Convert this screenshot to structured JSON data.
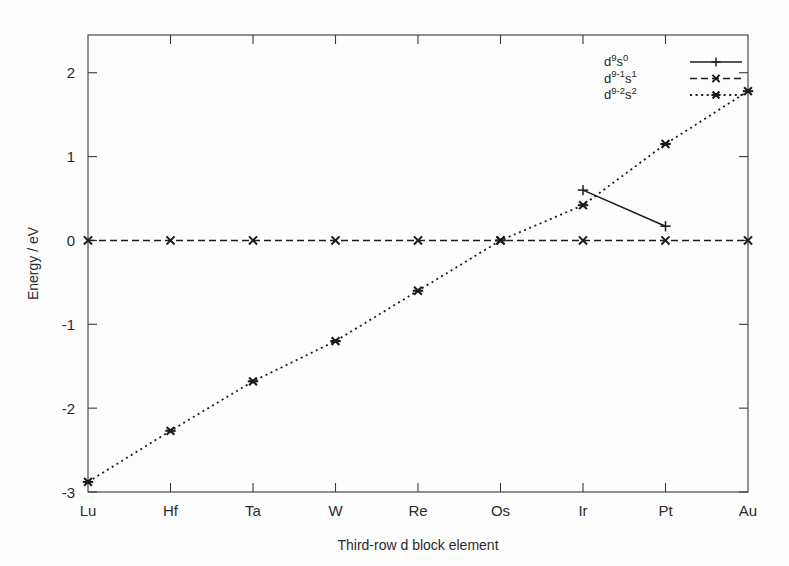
{
  "figure": {
    "background_color": "#fdfdfd",
    "ink_color": "#1c1c1c",
    "axis_color": "#3a3a3a"
  },
  "axes": {
    "x_title": "Third-row d block element",
    "y_title": "Energy / eV",
    "x_categories": [
      "Lu",
      "Hf",
      "Ta",
      "W",
      "Re",
      "Os",
      "Ir",
      "Pt",
      "Au"
    ],
    "y_ticks": [
      "2",
      "1",
      "0",
      "-1",
      "-2",
      "-3"
    ],
    "y_tick_values": [
      2,
      1,
      0,
      -1,
      -2,
      -3
    ],
    "y_min": -3,
    "y_max": 2.45,
    "grid": false
  },
  "legend": {
    "position": "top-right",
    "entries": [
      {
        "base1": "d",
        "sup1": "9",
        "base2": "s",
        "sup2": "0",
        "label": "d9s0",
        "line_style": "solid",
        "marker": "plus"
      },
      {
        "base1": "d",
        "sup1": "9-1",
        "base2": "s",
        "sup2": "1",
        "label": "d9-1s1",
        "line_style": "dashed",
        "marker": "cross"
      },
      {
        "base1": "d",
        "sup1": "9-2",
        "base2": "s",
        "sup2": "2",
        "label": "d9-2s2",
        "line_style": "dotted",
        "marker": "star-square"
      }
    ]
  },
  "chart_data": {
    "type": "line",
    "title": "",
    "xlabel": "Third-row d block element",
    "ylabel": "Energy / eV",
    "categories": [
      "Lu",
      "Hf",
      "Ta",
      "W",
      "Re",
      "Os",
      "Ir",
      "Pt",
      "Au"
    ],
    "ylim": [
      -3,
      2.45
    ],
    "grid": false,
    "legend_position": "top-right",
    "series": [
      {
        "name": "d9s0",
        "line_style": "solid",
        "marker": "plus",
        "x": [
          "Ir",
          "Pt"
        ],
        "values": [
          0.6,
          0.17
        ]
      },
      {
        "name": "d9-1s1",
        "line_style": "dashed",
        "marker": "cross",
        "x": [
          "Lu",
          "Hf",
          "Ta",
          "W",
          "Re",
          "Os",
          "Ir",
          "Pt",
          "Au"
        ],
        "values": [
          0.0,
          0.0,
          0.0,
          0.0,
          0.0,
          0.0,
          0.0,
          0.0,
          0.0
        ]
      },
      {
        "name": "d9-2s2",
        "line_style": "dotted",
        "marker": "star-square",
        "x": [
          "Lu",
          "Hf",
          "Ta",
          "W",
          "Re",
          "Os",
          "Ir",
          "Pt",
          "Au"
        ],
        "values": [
          -2.88,
          -2.27,
          -1.68,
          -1.2,
          -0.6,
          0.0,
          0.42,
          1.15,
          1.78
        ]
      }
    ]
  }
}
